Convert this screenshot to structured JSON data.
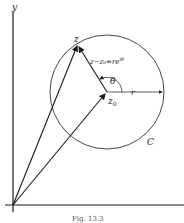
{
  "diagram": {
    "axis_labels": {
      "y": "y"
    },
    "point_z": "z",
    "point_z0_base": "z",
    "point_z0_sub": "0",
    "vector_label": "z−z₀=re",
    "vector_label_exp": "iθ",
    "angle_label": "θ",
    "radius_label": "r",
    "circle_label": "C",
    "caption": "Fig. 13.3",
    "colors": {
      "ink": "#1a1a1a",
      "background": "#ffffff"
    }
  }
}
